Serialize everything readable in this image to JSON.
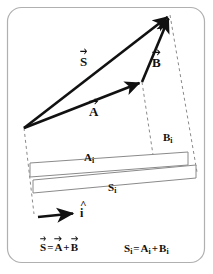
{
  "figure": {
    "frame": {
      "stroke_color": "#b0b0b0",
      "corner_radius": 14
    },
    "colors": {
      "vector_stroke": "#111111",
      "dashed_stroke": "#8a8a8a",
      "strip_stroke": "#8a8a8a",
      "text": "#111111",
      "background": "#ffffff"
    },
    "vectors": [
      {
        "name": "S",
        "label": "S",
        "accent": "arrow",
        "description": "resultant vector from origin to tip",
        "from": [
          24,
          128
        ],
        "to": [
          170,
          15
        ],
        "label_pos": [
          80,
          55
        ]
      },
      {
        "name": "A",
        "label": "A",
        "accent": "arrow",
        "description": "first addend vector from origin",
        "from": [
          24,
          128
        ],
        "to": [
          142,
          82
        ],
        "label_pos": [
          89,
          105
        ]
      },
      {
        "name": "B",
        "label": "B",
        "accent": "arrow",
        "description": "second addend vector from tip of A to tip of S",
        "from": [
          142,
          82
        ],
        "to": [
          170,
          15
        ],
        "label_pos": [
          152,
          56
        ]
      },
      {
        "name": "i-hat",
        "label": "i",
        "accent": "hat",
        "description": "unit vector defining the projection direction",
        "from": [
          38,
          217
        ],
        "to": [
          76,
          213
        ],
        "label_pos": [
          80,
          207
        ]
      }
    ],
    "components": [
      {
        "name": "A_i",
        "base": "A",
        "subscript": "i",
        "label_pos": [
          84,
          152
        ],
        "description": "scalar component of A along i-hat (upper strip)"
      },
      {
        "name": "B_i",
        "base": "B",
        "subscript": "i",
        "label_pos": [
          163,
          132
        ],
        "description": "scalar component of B along i-hat (upper right segment)"
      },
      {
        "name": "S_i",
        "base": "S",
        "subscript": "i",
        "label_pos": [
          108,
          182
        ],
        "description": "scalar component of S along i-hat (lower strip)"
      }
    ],
    "strips": [
      {
        "name": "A_i-strip",
        "points": "30,163 188,152 188,165 30,177",
        "description": "thin quadrilateral strip representing A sub i"
      },
      {
        "name": "S_i-strip",
        "points": "33,180 196,165 196,178 33,193",
        "description": "thin quadrilateral strip representing S sub i"
      }
    ],
    "dashed_lines": [
      {
        "name": "origin-projection-line",
        "from": [
          24,
          128
        ],
        "to": [
          34,
          214
        ]
      },
      {
        "name": "A-tip-projection-line",
        "from": [
          142,
          82
        ],
        "to": [
          155,
          168
        ]
      },
      {
        "name": "S-tip-projection-line",
        "from": [
          170,
          15
        ],
        "to": [
          197,
          172
        ]
      }
    ]
  },
  "equations": {
    "vector_equation": {
      "name": "vector-sum-equation",
      "lhs": "S",
      "op1": "=",
      "rhs1": "A",
      "op2": "+",
      "rhs2": "B",
      "text": "S = A + B",
      "pos": [
        40,
        245
      ]
    },
    "scalar_equation": {
      "name": "scalar-sum-equation",
      "lhs": "S",
      "lhs_sub": "i",
      "op1": "=",
      "rhs1": "A",
      "rhs1_sub": "i",
      "op2": "+",
      "rhs2": "B",
      "rhs2_sub": "i",
      "text": "S_i = A_i + B_i",
      "pos": [
        124,
        245
      ]
    }
  }
}
